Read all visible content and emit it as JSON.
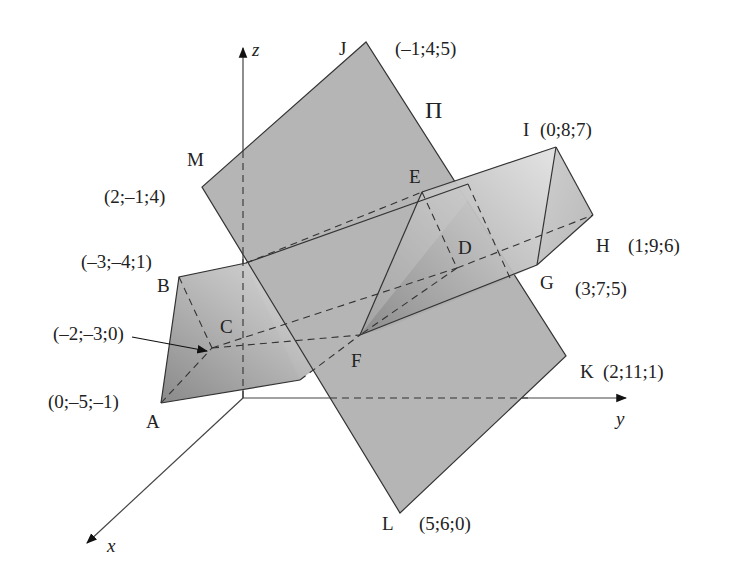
{
  "figure": {
    "axes": {
      "x_label": "x",
      "y_label": "y",
      "z_label": "z"
    },
    "plane": {
      "label": "Π",
      "fill": "#b3b3b3",
      "vertices": [
        {
          "name": "J",
          "coords": "(–1;4;5)"
        },
        {
          "name": "M",
          "coords": "(2;–1;4)"
        },
        {
          "name": "L",
          "coords": "(5;6;0)"
        },
        {
          "name": "K",
          "coords": "(2;11;1)"
        }
      ]
    },
    "prism": {
      "fill_dark": "#8f8f8f",
      "fill_light": "#d8d8d8",
      "vertices": [
        {
          "name": "A",
          "coords": "(0;–5;–1)"
        },
        {
          "name": "B",
          "coords": "(–3;–4;1)"
        },
        {
          "name": "C",
          "coords": "(–2;–3;0)"
        },
        {
          "name": "D",
          "coords": ""
        },
        {
          "name": "E",
          "coords": ""
        },
        {
          "name": "F",
          "coords": ""
        },
        {
          "name": "G",
          "coords": "(3;7;5)"
        },
        {
          "name": "H",
          "coords": "(1;9;6)"
        },
        {
          "name": "I",
          "coords": "(0;8;7)"
        }
      ]
    }
  }
}
